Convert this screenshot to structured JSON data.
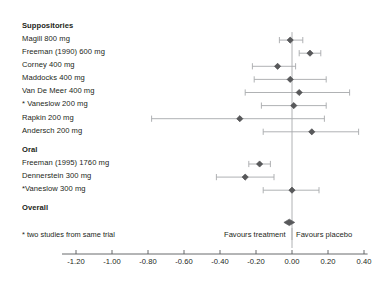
{
  "chart_data": {
    "type": "scatter",
    "subtype": "forest-plot",
    "title": "",
    "xlabel": "",
    "ylabel": "",
    "xlim": [
      -1.3,
      0.42
    ],
    "axis_ticks": [
      -1.2,
      -1.0,
      -0.8,
      -0.6,
      -0.4,
      -0.2,
      0.0,
      0.2,
      0.4
    ],
    "axis_tick_labels": [
      "-1.20",
      "-1.00",
      "-0.80",
      "-0.60",
      "-0.40",
      "-0.20",
      "0.00",
      "0.20",
      "0.40"
    ],
    "reference_line": 0.0,
    "grid": false,
    "legend": [],
    "favours_left_label": "Favours treatment",
    "favours_right_label": "Favours placebo",
    "footnote": "* two studies from same trial",
    "marker_color": "#58595b",
    "line_color": "#a7a9ac",
    "axis_color": "#58595b",
    "groups": [
      {
        "name": "Suppositories",
        "rows": [
          {
            "label": "Magill 800 mg",
            "estimate": -0.01,
            "ci_low": -0.07,
            "ci_high": 0.06
          },
          {
            "label": "Freeman (1990) 600 mg",
            "estimate": 0.1,
            "ci_low": 0.04,
            "ci_high": 0.16
          },
          {
            "label": "Corney 400 mg",
            "estimate": -0.08,
            "ci_low": -0.22,
            "ci_high": 0.02
          },
          {
            "label": "Maddocks 400 mg",
            "estimate": -0.01,
            "ci_low": -0.21,
            "ci_high": 0.19
          },
          {
            "label": "Van De Meer 400 mg",
            "estimate": 0.04,
            "ci_low": -0.26,
            "ci_high": 0.32
          },
          {
            "label": "* Vaneslow 200 mg",
            "estimate": 0.01,
            "ci_low": -0.17,
            "ci_high": 0.19
          },
          {
            "label": "Rapkin 200 mg",
            "estimate": -0.29,
            "ci_low": -0.78,
            "ci_high": 0.18
          },
          {
            "label": "Andersch 200 mg",
            "estimate": 0.11,
            "ci_low": -0.16,
            "ci_high": 0.37
          }
        ]
      },
      {
        "name": "Oral",
        "rows": [
          {
            "label": "Freeman (1995) 1760 mg",
            "estimate": -0.18,
            "ci_low": -0.24,
            "ci_high": -0.12
          },
          {
            "label": "Dennerstein 300 mg",
            "estimate": -0.26,
            "ci_low": -0.42,
            "ci_high": -0.1
          },
          {
            "label": "*Vaneslow 300 mg",
            "estimate": 0.0,
            "ci_low": -0.16,
            "ci_high": 0.15
          }
        ]
      },
      {
        "name": "Overall",
        "rows": [
          {
            "label": "",
            "estimate": -0.015,
            "ci_low": -0.045,
            "ci_high": 0.015,
            "diamond": true
          }
        ]
      }
    ]
  }
}
